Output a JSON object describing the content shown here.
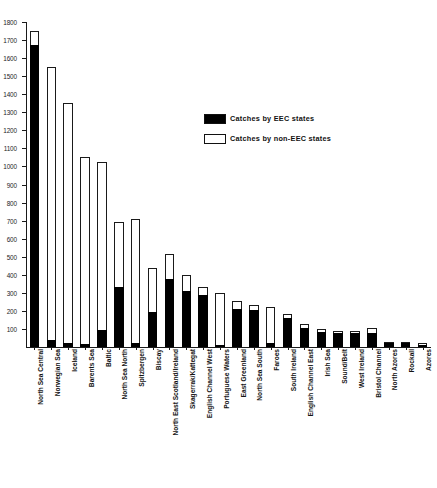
{
  "chart_data": {
    "type": "bar",
    "title": "",
    "subtitle": "",
    "xlabel": "",
    "ylabel": "",
    "stacked": true,
    "grid": false,
    "legend_position": "inside-top-right",
    "ylim": [
      0,
      1800
    ],
    "ytick_step": 100,
    "ytick_labels": [
      "1800",
      "1700",
      "1600",
      "1500",
      "1400",
      "1300",
      "1200",
      "1100",
      "1000",
      "900",
      "800",
      "700",
      "600",
      "500",
      "400",
      "300",
      "200",
      "100"
    ],
    "ytick_values": [
      1800,
      1700,
      1600,
      1500,
      1400,
      1300,
      1200,
      1100,
      1000,
      900,
      800,
      700,
      600,
      500,
      400,
      300,
      200,
      100
    ],
    "categories": [
      "North Sea Central",
      "Norwegian Sea",
      "Iceland",
      "Barents Sea",
      "Baltic",
      "North Sea North",
      "Spitzbergen",
      "Biscay",
      "North East Scotland/Ireland",
      "Skagerrak/Kattegat",
      "English Channel West",
      "Portuguese Waters",
      "East Greenland",
      "North Sea South",
      "Faroes",
      "South Ireland",
      "English Channel East",
      "Irish Sea",
      "Sound/Belt",
      "West Ireland",
      "Bristol Channel",
      "North Azores",
      "Rockall",
      "Azores"
    ],
    "series": [
      {
        "name": "Catches by EEC states",
        "color": "#000000",
        "values": [
          1675,
          40,
          20,
          15,
          95,
          330,
          20,
          195,
          375,
          310,
          290,
          10,
          210,
          205,
          25,
          160,
          105,
          85,
          80,
          80,
          80,
          20,
          25,
          10
        ]
      },
      {
        "name": "Catches by non-EEC states",
        "color": "#ffffff",
        "values": [
          75,
          1510,
          1330,
          1035,
          930,
          365,
          690,
          245,
          140,
          90,
          40,
          290,
          45,
          30,
          195,
          25,
          20,
          15,
          10,
          10,
          25,
          10,
          5,
          15
        ]
      }
    ],
    "totals": [
      1750,
      1550,
      1350,
      1050,
      1025,
      695,
      710,
      440,
      515,
      400,
      330,
      300,
      255,
      235,
      220,
      185,
      125,
      100,
      90,
      90,
      105,
      30,
      30,
      25
    ]
  },
  "legend": {
    "items": [
      {
        "label": "Catches by EEC states",
        "swatch": "filled"
      },
      {
        "label": "Catches by non-EEC states",
        "swatch": "hollow"
      }
    ]
  }
}
